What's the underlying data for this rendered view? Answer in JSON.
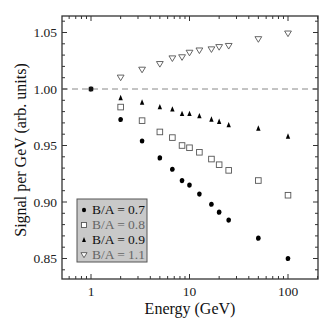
{
  "chart_data": {
    "type": "scatter",
    "title": "",
    "xlabel": "Energy (GeV)",
    "ylabel": "Signal per GeV (arb. units)",
    "xscale": "log",
    "xlim": [
      0.51,
      196
    ],
    "ylim": [
      0.832,
      1.065
    ],
    "xticks": [
      1,
      10,
      100
    ],
    "xtick_labels": [
      "1",
      "10",
      "100"
    ],
    "yticks": [
      0.85,
      0.9,
      0.95,
      1.0,
      1.05
    ],
    "ytick_labels": [
      "0.85",
      "0.90",
      "0.95",
      "1.00",
      "1.05"
    ],
    "grid": false,
    "reference_line": {
      "y": 1.0,
      "style": "dashed",
      "color": "#888888"
    },
    "legend_position": "lower left",
    "x": [
      1,
      2,
      3.3,
      5,
      6.7,
      8.4,
      10,
      12.6,
      16.7,
      20,
      25,
      50,
      100
    ],
    "series": [
      {
        "name": "B/A = 0.7",
        "marker": "filled-circle",
        "color": "#000000",
        "label_color": "#111111",
        "values": [
          1.0,
          0.973,
          0.954,
          0.939,
          0.929,
          0.919,
          0.915,
          0.907,
          0.898,
          0.891,
          0.884,
          0.868,
          0.85
        ]
      },
      {
        "name": "B/A = 0.8",
        "marker": "open-square",
        "color": "#555555",
        "label_color": "#666666",
        "values": [
          1.0,
          0.984,
          0.972,
          0.962,
          0.957,
          0.95,
          0.948,
          0.944,
          0.938,
          0.933,
          0.928,
          0.919,
          0.906
        ]
      },
      {
        "name": "B/A = 0.9",
        "marker": "filled-triangle-up",
        "color": "#000000",
        "label_color": "#111111",
        "values": [
          1.0,
          0.992,
          0.988,
          0.984,
          0.982,
          0.978,
          0.978,
          0.976,
          0.973,
          0.971,
          0.968,
          0.965,
          0.958
        ]
      },
      {
        "name": "B/A = 1.1",
        "marker": "open-triangle-down",
        "color": "#555555",
        "label_color": "#666666",
        "values": [
          1.0,
          1.01,
          1.017,
          1.022,
          1.027,
          1.028,
          1.032,
          1.034,
          1.035,
          1.037,
          1.038,
          1.044,
          1.049
        ]
      }
    ]
  },
  "legend": {
    "items": [
      {
        "label": "B/A = 0.7"
      },
      {
        "label": "B/A = 0.8"
      },
      {
        "label": "B/A = 0.9"
      },
      {
        "label": "B/A = 1.1"
      }
    ]
  },
  "axes": {
    "xlabel": "Energy (GeV)",
    "ylabel": "Signal per GeV (arb. units)"
  }
}
